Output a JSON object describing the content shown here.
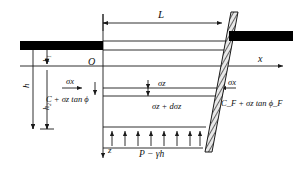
{
  "figure": {
    "type": "engineering-diagram",
    "background_color": "#ffffff",
    "line_color": "#1a1a1a",
    "fill_color": "#000000"
  },
  "axes": {
    "origin_label": "O",
    "x_axis_label": "x",
    "z_axis_label": "z",
    "x_direction": "right",
    "z_direction": "down"
  },
  "dimensions": {
    "span_label": "L",
    "total_depth_label": "h",
    "upper_depth_label": "h₁",
    "lower_depth_label": "h₂"
  },
  "stresses": {
    "lateral_left": "σx",
    "lateral_center": "σz",
    "lateral_right": "σx",
    "element_top": "σz",
    "element_bottom": "σz + dσz",
    "left_shear": "C + σz tan ϕ",
    "right_shear": "C_F + σz tan ϕ_F",
    "uplift_pressure": "P − γh",
    "uplift_arrow_count": 8
  },
  "members": {
    "left_slab": "left-black-slab",
    "right_slab": "right-black-slab",
    "diagonal": "hatched-inclined-wall"
  }
}
